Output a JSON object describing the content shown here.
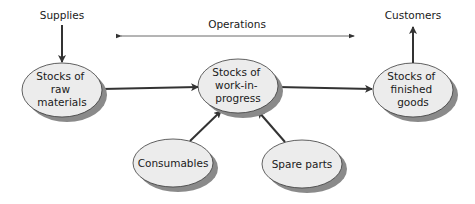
{
  "diagram": {
    "type": "inventory-flow",
    "colors": {
      "node_fill": "#ececec",
      "node_stroke": "#3a3a3a",
      "shadow": "#8a8a8a",
      "arrow": "#333333",
      "text": "#1a1a1a"
    },
    "labels": {
      "supplies": "Supplies",
      "operations": "Operations",
      "customers": "Customers"
    },
    "nodes": [
      {
        "id": "raw",
        "lines": [
          "Stocks of",
          "raw",
          "materials"
        ]
      },
      {
        "id": "wip",
        "lines": [
          "Stocks of",
          "work-in-",
          "progress"
        ]
      },
      {
        "id": "finished",
        "lines": [
          "Stocks of",
          "finished",
          "goods"
        ]
      },
      {
        "id": "consumables",
        "lines": [
          "Consumables"
        ]
      },
      {
        "id": "spare",
        "lines": [
          "Spare parts"
        ]
      }
    ],
    "edges": [
      {
        "from": "Supplies",
        "to": "raw"
      },
      {
        "from": "raw",
        "to": "wip"
      },
      {
        "from": "wip",
        "to": "finished"
      },
      {
        "from": "finished",
        "to": "Customers"
      },
      {
        "from": "consumables",
        "to": "wip"
      },
      {
        "from": "spare",
        "to": "wip"
      }
    ]
  }
}
